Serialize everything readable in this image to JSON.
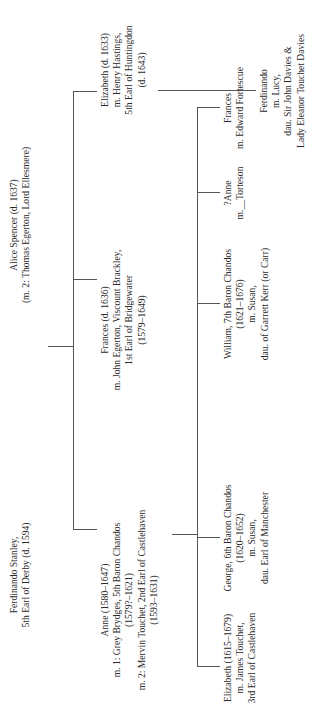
{
  "diagram": {
    "type": "family-tree",
    "orientation": "rotated-90-ccw",
    "generation_0": {
      "father": {
        "lines": [
          "Ferdinando Stanley,",
          "5th Earl of Derby (d. 1594)"
        ]
      },
      "mother": {
        "lines": [
          "Alice Spencer (d. 1637)",
          "(m. 2: Thomas Egerton, Lord Ellesmere)"
        ]
      }
    },
    "generation_1": [
      {
        "id": "anne",
        "lines": [
          "Anne (1580–1647)",
          "m. 1: Grey Brydges, 5th Baron Chandos",
          "(1579?–1621)",
          "m. 2: Mervin Touchet, 2nd Earl of Castlehaven",
          "(1593–1631)"
        ]
      },
      {
        "id": "frances",
        "lines": [
          "Frances (d. 1636)",
          "m. John Egerton, Viscount Brackley,",
          "1st Earl of Bridgewater",
          "(1579–1649)"
        ]
      },
      {
        "id": "elizabeth",
        "lines": [
          "Elizabeth (d. 1633)",
          "m. Henry Hastings,",
          "5th Earl of Huntingdon",
          "(d. 1643)"
        ]
      }
    ],
    "generation_2_anne_children": [
      {
        "id": "elizabeth-touchet",
        "lines": [
          "Elizabeth (1615–1679)",
          "m. James Touchet,",
          "3rd Earl of Castlehaven"
        ]
      },
      {
        "id": "george",
        "lines": [
          "George, 6th Baron Chandos",
          "(1620–1652)",
          "m. Susan,",
          "dau. Earl of Manchester"
        ]
      },
      {
        "id": "william",
        "lines": [
          "William, 7th Baron Chandos",
          "(1621–1676)",
          "m. Susan,",
          "dau. of Garrett Kerr (or Carr)"
        ]
      },
      {
        "id": "anne-q",
        "lines": [
          "?Anne",
          "m.__Torteson"
        ]
      },
      {
        "id": "frances-fortescue",
        "lines": [
          "Frances",
          "m. Edward Fortescue"
        ]
      }
    ],
    "generation_2_elizabeth_children": [
      {
        "id": "ferdinando-hastings",
        "lines": [
          "Ferdinando",
          "m. Lucy,",
          "dau. Sir John Davies &",
          "Lady Eleanor Touchet Davies"
        ]
      }
    ],
    "colors": {
      "line": "#555555",
      "text": "#2a2a2a",
      "background": "#ffffff"
    }
  }
}
